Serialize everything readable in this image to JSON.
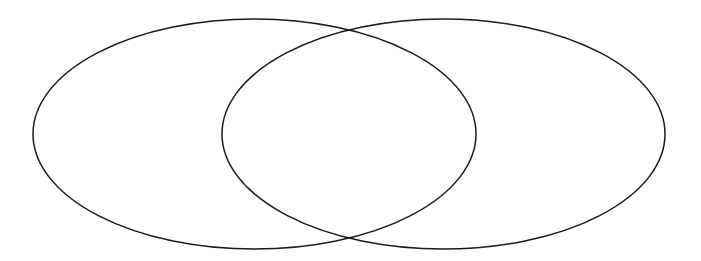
{
  "diagram": {
    "type": "venn",
    "background_color": "#ffffff",
    "stroke_color": "#1a1a1a",
    "sets": [
      {
        "id": "left-set",
        "label": "",
        "cx": 254.5,
        "cy": 134,
        "rx": 221.5,
        "ry": 115
      },
      {
        "id": "right-set",
        "label": "",
        "cx": 443.5,
        "cy": 134,
        "rx": 221.5,
        "ry": 115
      }
    ],
    "intersection_label": ""
  }
}
